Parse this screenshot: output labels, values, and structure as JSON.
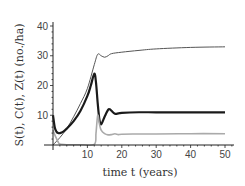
{
  "chart_data": {
    "type": "line",
    "title": "",
    "xlabel": "time t (years)",
    "ylabel": "S(t), C(t), Z(t) (no./ha)",
    "xlim": [
      0,
      50
    ],
    "ylim": [
      0,
      40
    ],
    "xticks": [
      10,
      20,
      30,
      40,
      50
    ],
    "yticks": [
      10,
      20,
      30,
      40
    ],
    "grid": false,
    "legend": "none",
    "series": [
      {
        "name": "upper thin curve",
        "color": "#555555",
        "width": 1,
        "x": [
          0,
          2,
          4,
          6,
          8,
          10,
          12,
          13,
          14,
          15,
          16,
          17,
          20,
          25,
          30,
          40,
          50
        ],
        "y": [
          0,
          2.5,
          5.5,
          9.5,
          14,
          19,
          27,
          30.5,
          30,
          29.5,
          30,
          30.7,
          31.2,
          31.8,
          32.3,
          32.8,
          33
        ]
      },
      {
        "name": "thick curve",
        "color": "#1a1a1a",
        "width": 2.2,
        "x": [
          0,
          0.5,
          1,
          1.5,
          2,
          3,
          4,
          6,
          8,
          10,
          11,
          12,
          12.5,
          13,
          13.5,
          14,
          15,
          16,
          16.5,
          17,
          18,
          19,
          20,
          25,
          30,
          40,
          50
        ],
        "y": [
          10,
          6,
          4.5,
          4,
          4,
          4.5,
          5.5,
          8,
          11.5,
          16.5,
          20,
          24,
          21,
          14,
          8.5,
          7,
          9.5,
          11.8,
          12,
          11.5,
          10.5,
          10.6,
          10.8,
          11,
          11,
          11,
          11
        ]
      },
      {
        "name": "light curve",
        "color": "#aaaaaa",
        "width": 1.6,
        "x": [
          0,
          0.5,
          1,
          1.5,
          2,
          4,
          8,
          12,
          12.5,
          13,
          13.5,
          14,
          15,
          16,
          17,
          18,
          19,
          20,
          25,
          30,
          40,
          50
        ],
        "y": [
          5,
          3.5,
          2.2,
          1,
          0.3,
          0.1,
          0.1,
          0.2,
          4,
          10,
          7,
          5,
          3.8,
          3.4,
          3.5,
          3.8,
          3.5,
          3.6,
          3.7,
          3.7,
          3.8,
          3.8
        ]
      }
    ]
  }
}
